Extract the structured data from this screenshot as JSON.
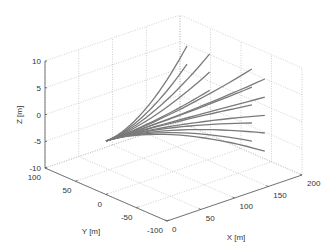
{
  "chart_data": {
    "type": "line",
    "subtype": "3d-trajectories",
    "title": "",
    "xlabel": "X [m]",
    "ylabel": "Y [m]",
    "zlabel": "Z [m]",
    "xlim": [
      0,
      200
    ],
    "ylim": [
      -100,
      100
    ],
    "zlim": [
      -10,
      10
    ],
    "xticks": [
      0,
      50,
      100,
      150,
      200
    ],
    "yticks": [
      -100,
      -50,
      0,
      50,
      100
    ],
    "zticks": [
      -10,
      -5,
      0,
      5,
      10
    ],
    "grid": true,
    "line_color": "#7a7a7a",
    "origin": [
      0,
      0,
      0
    ],
    "series": [
      {
        "name": "traj-1",
        "end": [
          120,
          0,
          12.6
        ]
      },
      {
        "name": "traj-2",
        "end": [
          140,
          -15,
          11.0
        ]
      },
      {
        "name": "traj-3",
        "end": [
          120,
          0,
          9.2
        ]
      },
      {
        "name": "traj-4",
        "end": [
          140,
          -15,
          7.6
        ]
      },
      {
        "name": "traj-5",
        "end": [
          140,
          -15,
          4.2
        ]
      },
      {
        "name": "traj-6",
        "end": [
          180,
          -40,
          7.7
        ]
      },
      {
        "name": "traj-7",
        "end": [
          190,
          -50,
          5.9
        ]
      },
      {
        "name": "traj-8",
        "end": [
          180,
          -40,
          4.3
        ]
      },
      {
        "name": "traj-9",
        "end": [
          190,
          -50,
          2.5
        ]
      },
      {
        "name": "traj-10",
        "end": [
          180,
          -40,
          1.0
        ]
      },
      {
        "name": "traj-11",
        "end": [
          190,
          -50,
          -0.9
        ]
      },
      {
        "name": "traj-12",
        "end": [
          180,
          -40,
          -2.4
        ]
      },
      {
        "name": "traj-13",
        "end": [
          190,
          -50,
          -4.2
        ]
      },
      {
        "name": "traj-14",
        "end": [
          180,
          -40,
          -5.8
        ]
      },
      {
        "name": "traj-15",
        "end": [
          190,
          -50,
          -7.6
        ]
      }
    ]
  }
}
